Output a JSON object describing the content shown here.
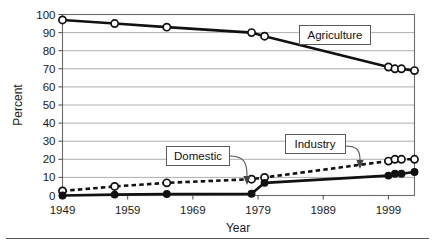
{
  "chart_data": {
    "type": "line",
    "title": "",
    "xlabel": "Year",
    "ylabel": "Percent",
    "xlim": [
      1949,
      2003
    ],
    "ylim": [
      0,
      100
    ],
    "xticks": [
      "1949",
      "1959",
      "1969",
      "1979",
      "1989",
      "1999"
    ],
    "xtick_values": [
      1949,
      1959,
      1969,
      1979,
      1989,
      1999
    ],
    "yticks": [
      "0",
      "10",
      "20",
      "30",
      "40",
      "50",
      "60",
      "70",
      "80",
      "90",
      "100"
    ],
    "ytick_values": [
      0,
      10,
      20,
      30,
      40,
      50,
      60,
      70,
      80,
      90,
      100
    ],
    "grid": true,
    "grid_axis": "y",
    "legend_position": "inline-callouts",
    "series": [
      {
        "name": "Agriculture",
        "marker": "open-circle",
        "line_style": "solid",
        "color": "#111111",
        "x": [
          1949,
          1957,
          1965,
          1978,
          1980,
          1999,
          2000,
          2001,
          2003
        ],
        "values": [
          97,
          95,
          93,
          90,
          88,
          71,
          70,
          70,
          69
        ]
      },
      {
        "name": "Industry",
        "marker": "open-circle",
        "line_style": "dashed",
        "color": "#111111",
        "x": [
          1949,
          1957,
          1965,
          1978,
          1980,
          1999,
          2000,
          2001,
          2003
        ],
        "values": [
          2.5,
          5,
          7,
          9,
          10,
          19,
          20,
          20,
          20
        ]
      },
      {
        "name": "Domestic",
        "marker": "filled-circle",
        "line_style": "solid",
        "color": "#111111",
        "x": [
          1949,
          1957,
          1965,
          1978,
          1980,
          1999,
          2000,
          2001,
          2003
        ],
        "values": [
          0,
          0.5,
          0.8,
          1,
          7,
          11,
          12,
          12,
          13
        ]
      }
    ],
    "annotations": [
      {
        "text": "Agriculture",
        "target_series": "Agriculture"
      },
      {
        "text": "Domestic",
        "target_series": "Domestic"
      },
      {
        "text": "Industry",
        "target_series": "Industry"
      }
    ]
  }
}
